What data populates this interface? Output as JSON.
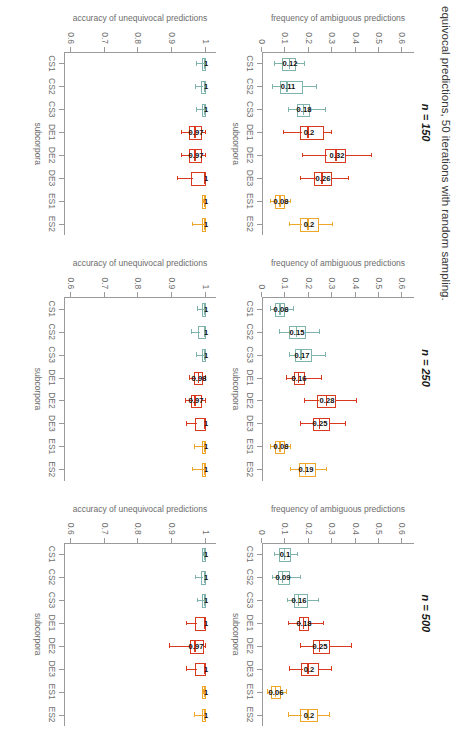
{
  "figure": {
    "title": "equivocal predictions, 50 iterations with random sampling.",
    "xlabel": "subcorpora",
    "categories": [
      "CS1",
      "CS2",
      "CS3",
      "DE1",
      "DE2",
      "DE3",
      "ES1",
      "ES2"
    ],
    "colors": {
      "teal": "#7FB3AE",
      "red": "#D93A1E",
      "orange": "#EFA72B",
      "axis": "#9a9a9a",
      "text": "#6d6d6d"
    }
  },
  "axes": {
    "top": {
      "ylabel": "frequency of ambiguous predictions",
      "ticks": [
        "0",
        "0.1",
        "0.2",
        "0.3",
        "0.4",
        "0.5",
        "0.6"
      ],
      "ylim": [
        0,
        0.65
      ]
    },
    "bottom": {
      "ylabel": "accuracy of unequivocal predictions",
      "ticks": [
        "0.6",
        "0.7",
        "0.8",
        "0.9",
        "1"
      ],
      "ylim": [
        0.58,
        1.03
      ]
    }
  },
  "panels": [
    {
      "title": "n = 150",
      "top": {
        "boxes": [
          {
            "cat": "CS1",
            "color": "teal",
            "low": 0.055,
            "q1": 0.095,
            "med": 0.12,
            "q3": 0.145,
            "high": 0.185,
            "label": "0.12"
          },
          {
            "cat": "CS2",
            "color": "teal",
            "low": 0.045,
            "q1": 0.085,
            "med": 0.11,
            "q3": 0.175,
            "high": 0.235,
            "label": "0.11"
          },
          {
            "cat": "CS3",
            "color": "teal",
            "low": 0.115,
            "q1": 0.16,
            "med": 0.18,
            "q3": 0.205,
            "high": 0.275,
            "label": "0.18"
          },
          {
            "cat": "DE1",
            "color": "red",
            "low": 0.095,
            "q1": 0.17,
            "med": 0.2,
            "q3": 0.265,
            "high": 0.3,
            "label": "0.2"
          },
          {
            "cat": "DE2",
            "color": "red",
            "low": 0.175,
            "q1": 0.28,
            "med": 0.32,
            "q3": 0.36,
            "high": 0.47,
            "label": "0.32"
          },
          {
            "cat": "DE3",
            "color": "red",
            "low": 0.165,
            "q1": 0.23,
            "med": 0.26,
            "q3": 0.3,
            "high": 0.37,
            "label": "0.26"
          },
          {
            "cat": "ES1",
            "color": "orange",
            "low": 0.04,
            "q1": 0.065,
            "med": 0.08,
            "q3": 0.1,
            "high": 0.125,
            "label": "0.08"
          },
          {
            "cat": "ES2",
            "color": "orange",
            "low": 0.12,
            "q1": 0.17,
            "med": 0.2,
            "q3": 0.245,
            "high": 0.305,
            "label": "0.2"
          }
        ]
      },
      "bottom": {
        "boxes": [
          {
            "cat": "CS1",
            "color": "teal",
            "low": 0.975,
            "q1": 0.993,
            "med": 1.0,
            "q3": 1.0,
            "high": 1.0,
            "label": "1"
          },
          {
            "cat": "CS2",
            "color": "teal",
            "low": 0.972,
            "q1": 0.992,
            "med": 1.0,
            "q3": 1.0,
            "high": 1.0,
            "label": "1"
          },
          {
            "cat": "CS3",
            "color": "teal",
            "low": 0.975,
            "q1": 0.993,
            "med": 1.0,
            "q3": 1.0,
            "high": 1.0,
            "label": "1"
          },
          {
            "cat": "DE1",
            "color": "red",
            "low": 0.93,
            "q1": 0.955,
            "med": 0.97,
            "q3": 0.988,
            "high": 1.0,
            "label": "0.97"
          },
          {
            "cat": "DE2",
            "color": "red",
            "low": 0.928,
            "q1": 0.955,
            "med": 0.97,
            "q3": 0.988,
            "high": 1.0,
            "label": "0.97"
          },
          {
            "cat": "DE3",
            "color": "red",
            "low": 0.918,
            "q1": 0.962,
            "med": 1.0,
            "q3": 1.0,
            "high": 1.0,
            "label": "1"
          },
          {
            "cat": "ES1",
            "color": "orange",
            "low": 0.995,
            "q1": 1.0,
            "med": 1.0,
            "q3": 1.0,
            "high": 1.0,
            "label": "1"
          },
          {
            "cat": "ES2",
            "color": "orange",
            "low": 0.962,
            "q1": 0.995,
            "med": 1.0,
            "q3": 1.0,
            "high": 1.0,
            "label": "1"
          }
        ]
      }
    },
    {
      "title": "n = 250",
      "top": {
        "boxes": [
          {
            "cat": "CS1",
            "color": "teal",
            "low": 0.04,
            "q1": 0.065,
            "med": 0.08,
            "q3": 0.1,
            "high": 0.135,
            "label": "0.08"
          },
          {
            "cat": "CS2",
            "color": "teal",
            "low": 0.075,
            "q1": 0.125,
            "med": 0.15,
            "q3": 0.19,
            "high": 0.25,
            "label": "0.15"
          },
          {
            "cat": "CS3",
            "color": "teal",
            "low": 0.12,
            "q1": 0.15,
            "med": 0.17,
            "q3": 0.215,
            "high": 0.275,
            "label": "0.17"
          },
          {
            "cat": "DE1",
            "color": "red",
            "low": 0.105,
            "q1": 0.145,
            "med": 0.16,
            "q3": 0.185,
            "high": 0.255,
            "label": "0.16"
          },
          {
            "cat": "DE2",
            "color": "red",
            "low": 0.185,
            "q1": 0.245,
            "med": 0.28,
            "q3": 0.315,
            "high": 0.405,
            "label": "0.28"
          },
          {
            "cat": "DE3",
            "color": "red",
            "low": 0.165,
            "q1": 0.225,
            "med": 0.25,
            "q3": 0.29,
            "high": 0.36,
            "label": "0.25"
          },
          {
            "cat": "ES1",
            "color": "orange",
            "low": 0.04,
            "q1": 0.065,
            "med": 0.08,
            "q3": 0.1,
            "high": 0.125,
            "label": "0.08"
          },
          {
            "cat": "ES2",
            "color": "orange",
            "low": 0.125,
            "q1": 0.165,
            "med": 0.19,
            "q3": 0.23,
            "high": 0.28,
            "label": "0.19"
          }
        ]
      },
      "bottom": {
        "boxes": [
          {
            "cat": "CS1",
            "color": "teal",
            "low": 0.978,
            "q1": 0.995,
            "med": 1.0,
            "q3": 1.0,
            "high": 1.0,
            "label": "1"
          },
          {
            "cat": "CS2",
            "color": "teal",
            "low": 0.96,
            "q1": 0.982,
            "med": 1.0,
            "q3": 1.0,
            "high": 1.0,
            "label": "1"
          },
          {
            "cat": "CS3",
            "color": "teal",
            "low": 0.975,
            "q1": 0.993,
            "med": 1.0,
            "q3": 1.0,
            "high": 1.0,
            "label": "1"
          },
          {
            "cat": "DE1",
            "color": "red",
            "low": 0.952,
            "q1": 0.972,
            "med": 0.98,
            "q3": 0.992,
            "high": 1.0,
            "label": "0.98"
          },
          {
            "cat": "DE2",
            "color": "red",
            "low": 0.94,
            "q1": 0.962,
            "med": 0.97,
            "q3": 0.988,
            "high": 1.0,
            "label": "0.97"
          },
          {
            "cat": "DE3",
            "color": "red",
            "low": 0.945,
            "q1": 0.975,
            "med": 1.0,
            "q3": 1.0,
            "high": 1.0,
            "label": "1"
          },
          {
            "cat": "ES1",
            "color": "orange",
            "low": 0.968,
            "q1": 0.995,
            "med": 1.0,
            "q3": 1.0,
            "high": 1.0,
            "label": "1"
          },
          {
            "cat": "ES2",
            "color": "orange",
            "low": 0.962,
            "q1": 0.995,
            "med": 1.0,
            "q3": 1.0,
            "high": 1.0,
            "label": "1"
          }
        ]
      }
    },
    {
      "title": "n = 500",
      "top": {
        "boxes": [
          {
            "cat": "CS1",
            "color": "teal",
            "low": 0.055,
            "q1": 0.08,
            "med": 0.1,
            "q3": 0.125,
            "high": 0.155,
            "label": "0.1"
          },
          {
            "cat": "CS2",
            "color": "teal",
            "low": 0.045,
            "q1": 0.075,
            "med": 0.09,
            "q3": 0.12,
            "high": 0.165,
            "label": "0.09"
          },
          {
            "cat": "CS3",
            "color": "teal",
            "low": 0.11,
            "q1": 0.145,
            "med": 0.16,
            "q3": 0.195,
            "high": 0.245,
            "label": "0.16"
          },
          {
            "cat": "DE1",
            "color": "red",
            "low": 0.115,
            "q1": 0.165,
            "med": 0.18,
            "q3": 0.2,
            "high": 0.265,
            "label": "0.18"
          },
          {
            "cat": "DE2",
            "color": "red",
            "low": 0.165,
            "q1": 0.225,
            "med": 0.25,
            "q3": 0.29,
            "high": 0.385,
            "label": "0.25"
          },
          {
            "cat": "DE3",
            "color": "red",
            "low": 0.12,
            "q1": 0.175,
            "med": 0.2,
            "q3": 0.245,
            "high": 0.3,
            "label": "0.2"
          },
          {
            "cat": "ES1",
            "color": "orange",
            "low": 0.025,
            "q1": 0.045,
            "med": 0.06,
            "q3": 0.08,
            "high": 0.105,
            "label": "0.06"
          },
          {
            "cat": "ES2",
            "color": "orange",
            "low": 0.115,
            "q1": 0.17,
            "med": 0.2,
            "q3": 0.24,
            "high": 0.29,
            "label": "0.2"
          }
        ]
      },
      "bottom": {
        "boxes": [
          {
            "cat": "CS1",
            "color": "teal",
            "low": 0.995,
            "q1": 1.0,
            "med": 1.0,
            "q3": 1.0,
            "high": 1.0,
            "label": "1"
          },
          {
            "cat": "CS2",
            "color": "teal",
            "low": 0.97,
            "q1": 0.992,
            "med": 1.0,
            "q3": 1.0,
            "high": 1.0,
            "label": "1"
          },
          {
            "cat": "CS3",
            "color": "teal",
            "low": 0.978,
            "q1": 0.995,
            "med": 1.0,
            "q3": 1.0,
            "high": 1.0,
            "label": "1"
          },
          {
            "cat": "DE1",
            "color": "red",
            "low": 0.945,
            "q1": 0.975,
            "med": 1.0,
            "q3": 1.0,
            "high": 1.0,
            "label": "1"
          },
          {
            "cat": "DE2",
            "color": "red",
            "low": 0.895,
            "q1": 0.958,
            "med": 0.97,
            "q3": 0.995,
            "high": 1.0,
            "label": "0.97"
          },
          {
            "cat": "DE3",
            "color": "red",
            "low": 0.945,
            "q1": 0.975,
            "med": 1.0,
            "q3": 1.0,
            "high": 1.0,
            "label": "1"
          },
          {
            "cat": "ES1",
            "color": "orange",
            "low": 0.995,
            "q1": 1.0,
            "med": 1.0,
            "q3": 1.0,
            "high": 1.0,
            "label": "1"
          },
          {
            "cat": "ES2",
            "color": "orange",
            "low": 0.968,
            "q1": 0.995,
            "med": 1.0,
            "q3": 1.0,
            "high": 1.0,
            "label": "1"
          }
        ]
      }
    }
  ],
  "chart_data": {
    "type": "bar",
    "title": "equivocal predictions, 50 iterations with random sampling.",
    "xlabel": "subcorpora",
    "categories": [
      "CS1",
      "CS2",
      "CS3",
      "DE1",
      "DE2",
      "DE3",
      "ES1",
      "ES2"
    ],
    "grid": false,
    "legend": "none",
    "panels_order": [
      "n = 150",
      "n = 250",
      "n = 500"
    ],
    "row1": {
      "ylabel": "frequency of ambiguous predictions",
      "ylim": [
        0,
        0.6
      ],
      "series": [
        {
          "name": "n = 150 median",
          "values": [
            0.12,
            0.11,
            0.18,
            0.2,
            0.32,
            0.26,
            0.08,
            0.2
          ]
        },
        {
          "name": "n = 250 median",
          "values": [
            0.08,
            0.15,
            0.17,
            0.16,
            0.28,
            0.25,
            0.08,
            0.19
          ]
        },
        {
          "name": "n = 500 median",
          "values": [
            0.1,
            0.09,
            0.16,
            0.18,
            0.25,
            0.2,
            0.06,
            0.2
          ]
        }
      ]
    },
    "row2": {
      "ylabel": "accuracy of unequivocal predictions",
      "ylim": [
        0.6,
        1.0
      ],
      "series": [
        {
          "name": "n = 150 median",
          "values": [
            1,
            1,
            1,
            0.97,
            0.97,
            1,
            1,
            1
          ]
        },
        {
          "name": "n = 250 median",
          "values": [
            1,
            1,
            1,
            0.98,
            0.97,
            1,
            1,
            1
          ]
        },
        {
          "name": "n = 500 median",
          "values": [
            1,
            1,
            1,
            1,
            0.97,
            1,
            1,
            1
          ]
        }
      ]
    }
  }
}
